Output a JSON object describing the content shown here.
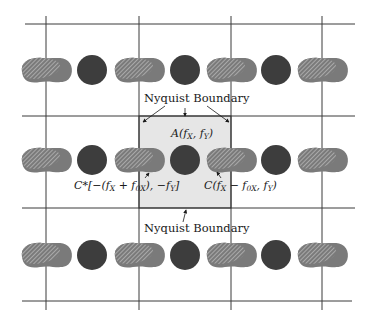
{
  "figure": {
    "type": "aliasing-spectrum-diagram",
    "grid": {
      "horizontal_lines_y": [
        24,
        116,
        208,
        301
      ],
      "vertical_lines_x": [
        46,
        139,
        231,
        322
      ],
      "line_color": "#3a3a3a"
    },
    "nyquist_region": {
      "x": 139,
      "y": 116,
      "width": 92,
      "height": 92,
      "fill": "#e6e6e6"
    },
    "rows_center_y": [
      70,
      160,
      255
    ],
    "circles_center_x": [
      92,
      185,
      276
    ],
    "blobs_center_x": [
      46,
      139,
      231,
      322
    ],
    "colors": {
      "circle": "#3d3d3d",
      "blob_fill": "#7a7a7a",
      "hatch": "#d8d8d8"
    }
  },
  "labels": {
    "nyquist_top": "Nyquist Boundary",
    "nyquist_bottom": "Nyquist Boundary",
    "A": {
      "prefix": "A(",
      "f1": "f",
      "s1": "X",
      "sep": ", ",
      "f2": "f",
      "s2": "Y",
      "suffix": ")"
    },
    "C": {
      "prefix": "C(",
      "f1": "f",
      "s1": "X",
      "mid": " − ",
      "f2": "f",
      "s2": "0X",
      "sep": ", ",
      "f3": "f",
      "s3": "Y",
      "suffix": ")"
    },
    "Cstar": {
      "prefix": "C*[−(",
      "f1": "f",
      "s1": "X",
      "mid": " + ",
      "f2": "f",
      "s2": "0X",
      "sep": "), −",
      "f3": "f",
      "s3": "Y",
      "suffix": "]"
    }
  }
}
